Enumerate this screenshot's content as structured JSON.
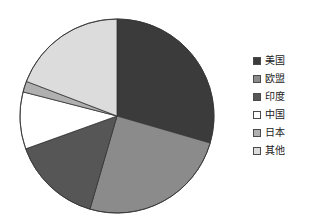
{
  "chart_data": {
    "type": "pie",
    "title": "",
    "subtitle": "",
    "xlabel": "",
    "ylabel": "",
    "grid": false,
    "legend_position": "right",
    "start_angle_deg": 0,
    "direction": "clockwise",
    "center": {
      "x": 117,
      "y": 116
    },
    "radius": 97,
    "categories": [
      "美国",
      "欧盟",
      "印度",
      "中国",
      "日本",
      "其他"
    ],
    "values": [
      29.5,
      25.0,
      15.0,
      9.5,
      1.8,
      19.2
    ],
    "colors": [
      "#3b3b3b",
      "#8b8b8b",
      "#565656",
      "#ffffff",
      "#b0b0b0",
      "#dcdcdc"
    ],
    "slices": [
      {
        "label": "美国",
        "value": 29.5,
        "color": "#3b3b3b",
        "start_deg": 0.0,
        "end_deg": 106.2
      },
      {
        "label": "欧盟",
        "value": 25.0,
        "color": "#8b8b8b",
        "start_deg": 106.2,
        "end_deg": 196.2
      },
      {
        "label": "印度",
        "value": 15.0,
        "color": "#565656",
        "start_deg": 196.2,
        "end_deg": 250.2
      },
      {
        "label": "中国",
        "value": 9.5,
        "color": "#ffffff",
        "start_deg": 250.2,
        "end_deg": 284.4
      },
      {
        "label": "日本",
        "value": 1.8,
        "color": "#b0b0b0",
        "start_deg": 284.4,
        "end_deg": 290.9
      },
      {
        "label": "其他",
        "value": 19.2,
        "color": "#dcdcdc",
        "start_deg": 290.9,
        "end_deg": 360.0
      }
    ],
    "stroke_color": "#333333",
    "stroke_width": 0.8
  },
  "legend": {
    "items": [
      {
        "label": "美国",
        "color": "#3b3b3b"
      },
      {
        "label": "欧盟",
        "color": "#8b8b8b"
      },
      {
        "label": "印度",
        "color": "#565656"
      },
      {
        "label": "中国",
        "color": "#ffffff"
      },
      {
        "label": "日本",
        "color": "#b0b0b0"
      },
      {
        "label": "其他",
        "color": "#dcdcdc"
      }
    ]
  }
}
